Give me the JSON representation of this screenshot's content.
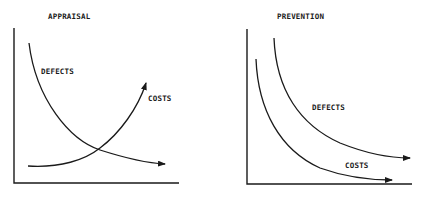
{
  "panels": [
    {
      "title": "APPRAISAL",
      "curves": [
        {
          "label": "DEFECTS",
          "trend": "decreasing"
        },
        {
          "label": "COSTS",
          "trend": "increasing"
        }
      ]
    },
    {
      "title": "PREVENTION",
      "curves": [
        {
          "label": "DEFECTS",
          "trend": "decreasing"
        },
        {
          "label": "COSTS",
          "trend": "decreasing"
        }
      ]
    }
  ],
  "colors": {
    "ink": "#1a1a1a",
    "background": "#ffffff"
  }
}
